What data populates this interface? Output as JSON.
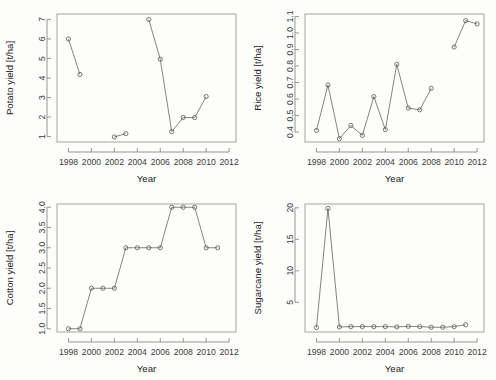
{
  "figure": {
    "background_color": "#fdfdfb",
    "line_color": "#6e6e6e",
    "marker_color": "#5a5a5a",
    "axis_color": "#8a8a8a",
    "text_color": "#222222",
    "panel_count": 4
  },
  "chart_data": [
    {
      "type": "line",
      "panel": "top-left",
      "title": "",
      "xlabel": "Year",
      "ylabel": "Potato yield [t/ha]",
      "xlim": [
        1997,
        2012.6
      ],
      "ylim": [
        0.72,
        7.28
      ],
      "xticks": [
        1998,
        2000,
        2002,
        2004,
        2006,
        2008,
        2010,
        2012
      ],
      "xticklabels": [
        "1998",
        "2000",
        "2002",
        "2004",
        "2006",
        "2008",
        "2010",
        "2012"
      ],
      "yticks": [
        1,
        2,
        3,
        4,
        5,
        6,
        7
      ],
      "yticklabels": [
        "1",
        "2",
        "3",
        "4",
        "5",
        "6",
        "7"
      ],
      "grid": false,
      "legend": "none",
      "marker": "circle-open",
      "segments": [
        {
          "x": [
            1998,
            1999
          ],
          "y": [
            6.0,
            4.18
          ]
        },
        {
          "x": [
            2002,
            2003
          ],
          "y": [
            0.98,
            1.15
          ]
        },
        {
          "x": [
            2005,
            2006,
            2007,
            2008,
            2009,
            2010
          ],
          "y": [
            7.0,
            4.96,
            1.25,
            1.98,
            1.97,
            3.05
          ]
        }
      ],
      "x": [
        1998,
        1999,
        2002,
        2003,
        2005,
        2006,
        2007,
        2008,
        2009,
        2010
      ],
      "values": [
        6.0,
        4.18,
        0.98,
        1.15,
        7.0,
        4.96,
        1.25,
        1.98,
        1.97,
        3.05
      ]
    },
    {
      "type": "line",
      "panel": "top-right",
      "title": "",
      "xlabel": "Year",
      "ylabel": "Rice yield [t/ha]",
      "xlim": [
        1997,
        2012.6
      ],
      "ylim": [
        0.34,
        1.115
      ],
      "xticks": [
        1998,
        2000,
        2002,
        2004,
        2006,
        2008,
        2010,
        2012
      ],
      "xticklabels": [
        "1998",
        "2000",
        "2002",
        "2004",
        "2006",
        "2008",
        "2010",
        "2012"
      ],
      "yticks": [
        0.4,
        0.5,
        0.6,
        0.7,
        0.8,
        0.9,
        1.0,
        1.1
      ],
      "yticklabels": [
        "0.4",
        "0.5",
        "0.6",
        "0.7",
        "0.8",
        "0.9",
        "1.0",
        "1.1"
      ],
      "grid": false,
      "legend": "none",
      "marker": "circle-open",
      "segments": [
        {
          "x": [
            1998,
            1999,
            2000,
            2001,
            2002,
            2003,
            2004,
            2005,
            2006,
            2007,
            2008
          ],
          "y": [
            0.41,
            0.685,
            0.36,
            0.44,
            0.38,
            0.615,
            0.415,
            0.81,
            0.545,
            0.535,
            0.665
          ]
        },
        {
          "x": [
            2010,
            2011,
            2012
          ],
          "y": [
            0.915,
            1.075,
            1.055
          ]
        }
      ],
      "x": [
        1998,
        1999,
        2000,
        2001,
        2002,
        2003,
        2004,
        2005,
        2006,
        2007,
        2008,
        2010,
        2011,
        2012
      ],
      "values": [
        0.41,
        0.685,
        0.36,
        0.44,
        0.38,
        0.615,
        0.415,
        0.81,
        0.545,
        0.535,
        0.665,
        0.915,
        1.075,
        1.055
      ]
    },
    {
      "type": "line",
      "panel": "bottom-left",
      "title": "",
      "xlabel": "Year",
      "ylabel": "Cotton yield [t/ha]",
      "xlim": [
        1997,
        2012.6
      ],
      "ylim": [
        0.92,
        4.08
      ],
      "xticks": [
        1998,
        2000,
        2002,
        2004,
        2006,
        2008,
        2010,
        2012
      ],
      "xticklabels": [
        "1998",
        "2000",
        "2002",
        "2004",
        "2006",
        "2008",
        "2010",
        "2012"
      ],
      "yticks": [
        1.0,
        1.5,
        2.0,
        2.5,
        3.0,
        3.5,
        4.0
      ],
      "yticklabels": [
        "1.0",
        "1.5",
        "2.0",
        "2.5",
        "3.0",
        "3.5",
        "4.0"
      ],
      "grid": false,
      "legend": "none",
      "marker": "circle-open",
      "segments": [
        {
          "x": [
            1998,
            1999,
            2000,
            2001,
            2002,
            2003,
            2004,
            2005,
            2006,
            2007,
            2008,
            2009,
            2010,
            2011
          ],
          "y": [
            1.0,
            1.0,
            2.0,
            2.0,
            2.0,
            3.0,
            3.0,
            3.0,
            3.0,
            4.0,
            4.0,
            4.0,
            3.0,
            3.0
          ]
        }
      ],
      "x": [
        1998,
        1999,
        2000,
        2001,
        2002,
        2003,
        2004,
        2005,
        2006,
        2007,
        2008,
        2009,
        2010,
        2011
      ],
      "values": [
        1.0,
        1.0,
        2.0,
        2.0,
        2.0,
        3.0,
        3.0,
        3.0,
        3.0,
        4.0,
        4.0,
        4.0,
        3.0,
        3.0
      ]
    },
    {
      "type": "line",
      "panel": "bottom-right",
      "title": "",
      "xlabel": "Year",
      "ylabel": "Sugarcane yield [t/ha]",
      "xlim": [
        1997,
        2012.6
      ],
      "ylim": [
        0.3,
        20.6
      ],
      "xticks": [
        1998,
        2000,
        2002,
        2004,
        2006,
        2008,
        2010,
        2012
      ],
      "xticklabels": [
        "1998",
        "2000",
        "2002",
        "2004",
        "2006",
        "2008",
        "2010",
        "2012"
      ],
      "yticks": [
        5,
        10,
        15,
        20
      ],
      "yticklabels": [
        "5",
        "10",
        "15",
        "20"
      ],
      "grid": false,
      "legend": "none",
      "marker": "circle-open",
      "segments": [
        {
          "x": [
            1998,
            1999,
            2000,
            2001,
            2002,
            2003,
            2004,
            2005,
            2006,
            2007,
            2008,
            2009,
            2010,
            2011
          ],
          "y": [
            1.0,
            19.9,
            1.1,
            1.15,
            1.15,
            1.15,
            1.15,
            1.1,
            1.2,
            1.15,
            1.05,
            1.05,
            1.15,
            1.45
          ]
        }
      ],
      "x": [
        1998,
        1999,
        2000,
        2001,
        2002,
        2003,
        2004,
        2005,
        2006,
        2007,
        2008,
        2009,
        2010,
        2011
      ],
      "values": [
        1.0,
        19.9,
        1.1,
        1.15,
        1.15,
        1.15,
        1.15,
        1.1,
        1.2,
        1.15,
        1.05,
        1.05,
        1.15,
        1.45
      ]
    }
  ]
}
